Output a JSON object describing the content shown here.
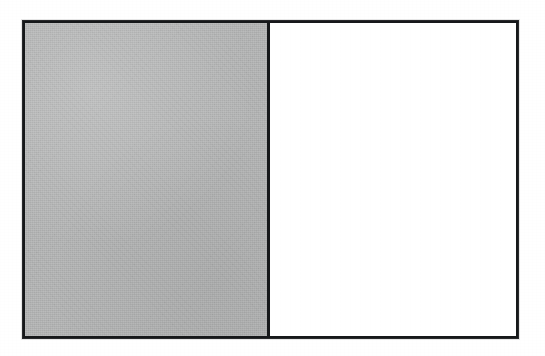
{
  "figure": {
    "caption": "",
    "background_color": "#ffffff",
    "frame": {
      "border_color": "#16181a",
      "border_width_px": 3,
      "x_px": 22,
      "y_px": 20,
      "width_px": 497,
      "height_px": 319
    },
    "divider": {
      "orientation": "vertical",
      "x_px": 270,
      "color": "#16181a",
      "width_px": 3
    },
    "panels": [
      {
        "id": "left",
        "label": "",
        "fill": "shaded",
        "fill_color": "#babbbb",
        "texture": "halftone-speckle",
        "width_px": 245,
        "content": ""
      },
      {
        "id": "right",
        "label": "",
        "fill": "empty",
        "fill_color": "#ffffff",
        "texture": "none",
        "width_px": 246,
        "content": ""
      }
    ]
  }
}
